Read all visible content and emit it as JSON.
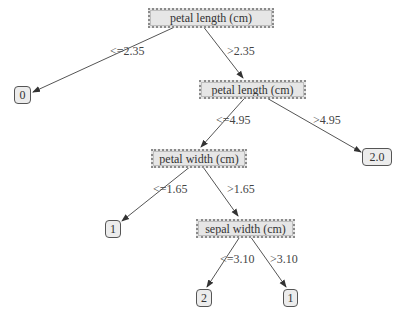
{
  "tree": {
    "nodes": {
      "root": {
        "label": "petal length (cm)",
        "type": "split"
      },
      "leaf_left_root": {
        "label": "0",
        "type": "leaf"
      },
      "n2": {
        "label": "petal length (cm)",
        "type": "split"
      },
      "leaf_right_n2": {
        "label": "2.0",
        "type": "leaf"
      },
      "n3": {
        "label": "petal width (cm)",
        "type": "split"
      },
      "leaf_left_n3": {
        "label": "1",
        "type": "leaf"
      },
      "n4": {
        "label": "sepal width (cm)",
        "type": "split"
      },
      "leaf_left_n4": {
        "label": "2",
        "type": "leaf"
      },
      "leaf_right_n4": {
        "label": "1",
        "type": "leaf"
      }
    },
    "edges": {
      "root_left": {
        "label": "<=2.35",
        "from": "root",
        "to": "leaf_left_root"
      },
      "root_right": {
        "label": ">2.35",
        "from": "root",
        "to": "n2"
      },
      "n2_left": {
        "label": "<=4.95",
        "from": "n2",
        "to": "n3"
      },
      "n2_right": {
        "label": ">4.95",
        "from": "n2",
        "to": "leaf_right_n2"
      },
      "n3_left": {
        "label": "<=1.65",
        "from": "n3",
        "to": "leaf_left_n3"
      },
      "n3_right": {
        "label": ">1.65",
        "from": "n3",
        "to": "n4"
      },
      "n4_left": {
        "label": "<=3.10",
        "from": "n4",
        "to": "leaf_left_n4"
      },
      "n4_right": {
        "label": ">3.10",
        "from": "n4",
        "to": "leaf_right_n4"
      }
    }
  },
  "colors": {
    "node_fill": "#e6e6e6",
    "edge": "#444444",
    "text": "#333333"
  }
}
